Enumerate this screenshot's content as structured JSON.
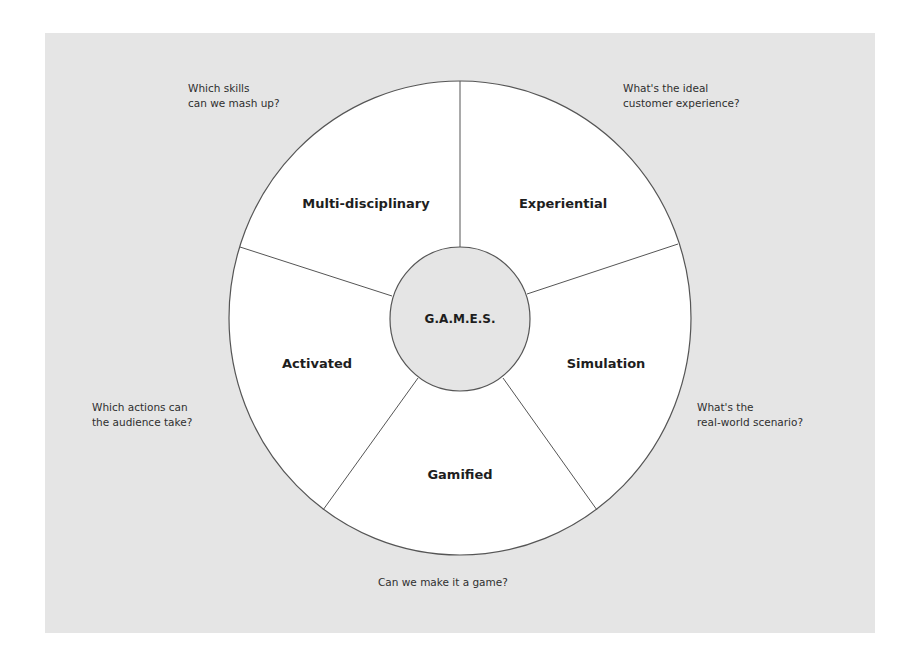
{
  "diagram": {
    "center": {
      "label": "G.A.M.E.S."
    },
    "segments": [
      {
        "id": "multi-disciplinary",
        "label": "Multi-disciplinary",
        "question_line1": "Which skills",
        "question_line2": "can we mash up?"
      },
      {
        "id": "experiential",
        "label": "Experiential",
        "question_line1": "What's the ideal",
        "question_line2": "customer experience?"
      },
      {
        "id": "simulation",
        "label": "Simulation",
        "question_line1": "What's the",
        "question_line2": "real-world scenario?"
      },
      {
        "id": "gamified",
        "label": "Gamified",
        "question_line1": "Can we make it a game?",
        "question_line2": ""
      },
      {
        "id": "activated",
        "label": "Activated",
        "question_line1": "Which actions can",
        "question_line2": "the audience take?"
      }
    ],
    "colors": {
      "panel_background": "#e5e5e5",
      "wheel_fill": "#ffffff",
      "hub_fill": "#e5e5e5",
      "stroke": "#555555",
      "text": "#1e1e1e"
    }
  }
}
